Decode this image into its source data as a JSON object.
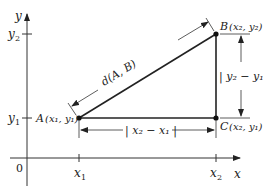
{
  "diagram": {
    "axes": {
      "x_label": "x",
      "y_label": "y",
      "origin_label": "0",
      "x_ticks": [
        {
          "label": "x",
          "sub": "1"
        },
        {
          "label": "x",
          "sub": "2"
        }
      ],
      "y_ticks": [
        {
          "label": "y",
          "sub": "1"
        },
        {
          "label": "y",
          "sub": "2"
        }
      ]
    },
    "points": {
      "A": {
        "name": "A",
        "coords": "(x₁, y₁)"
      },
      "B": {
        "name": "B",
        "coords": "(x₂, y₂)"
      },
      "C": {
        "name": "C",
        "coords": "(x₂, y₁)"
      }
    },
    "segments": {
      "hypotenuse_label": "d(A, B)",
      "horizontal_label": "| x₂ − x₁ |",
      "vertical_label": "| y₂ − y₁"
    },
    "colors": {
      "line": "#222222",
      "axis": "#333333",
      "background": "#ffffff"
    }
  }
}
